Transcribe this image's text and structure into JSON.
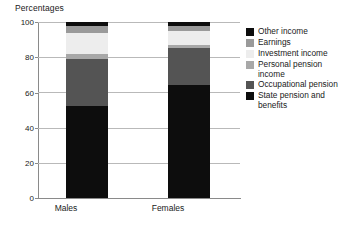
{
  "chart_data": {
    "type": "bar",
    "subtype": "stacked-vertical-100",
    "title": "Percentages",
    "xlabel": "",
    "ylabel": "Percentages",
    "categories": [
      "Males",
      "Females"
    ],
    "ylim": [
      0,
      100
    ],
    "yticks": [
      0,
      20,
      40,
      60,
      80,
      100
    ],
    "ytick_labels": [
      "0",
      "20",
      "40",
      "60",
      "80",
      "100"
    ],
    "grid": true,
    "legend_position": "right",
    "series": [
      {
        "name": "State pension and benefits",
        "values": [
          52,
          64
        ],
        "color": "#0d0d0d"
      },
      {
        "name": "Occupational pension",
        "values": [
          27,
          21
        ],
        "color": "#545454"
      },
      {
        "name": "Personal pension income",
        "values": [
          3,
          2
        ],
        "color": "#a8a8a8"
      },
      {
        "name": "Investment income",
        "values": [
          12,
          8
        ],
        "color": "#ededed"
      },
      {
        "name": "Earnings",
        "values": [
          4,
          3
        ],
        "color": "#9a9a9a"
      },
      {
        "name": "Other income",
        "values": [
          2,
          2
        ],
        "color": "#0d0d0d"
      }
    ]
  },
  "axis": {
    "title": "Percentages",
    "ytick_labels": [
      "100",
      "80",
      "60",
      "40",
      "20",
      "0"
    ],
    "category_labels": [
      "Males",
      "Females"
    ]
  },
  "legend": {
    "items": [
      {
        "label": "Other income",
        "color": "#0d0d0d"
      },
      {
        "label": "Earnings",
        "color": "#9a9a9a"
      },
      {
        "label": "Investment income",
        "color": "#ededed"
      },
      {
        "label": "Personal pension\nincome",
        "color": "#a8a8a8"
      },
      {
        "label": "Occupational pension",
        "color": "#545454"
      },
      {
        "label": "State pension and\nbenefits",
        "color": "#0d0d0d"
      }
    ]
  },
  "colors": {
    "background": "#ffffff",
    "gridline": "#b9b9b9",
    "axis": "#8a8a8a",
    "text": "#1a1a1a"
  }
}
